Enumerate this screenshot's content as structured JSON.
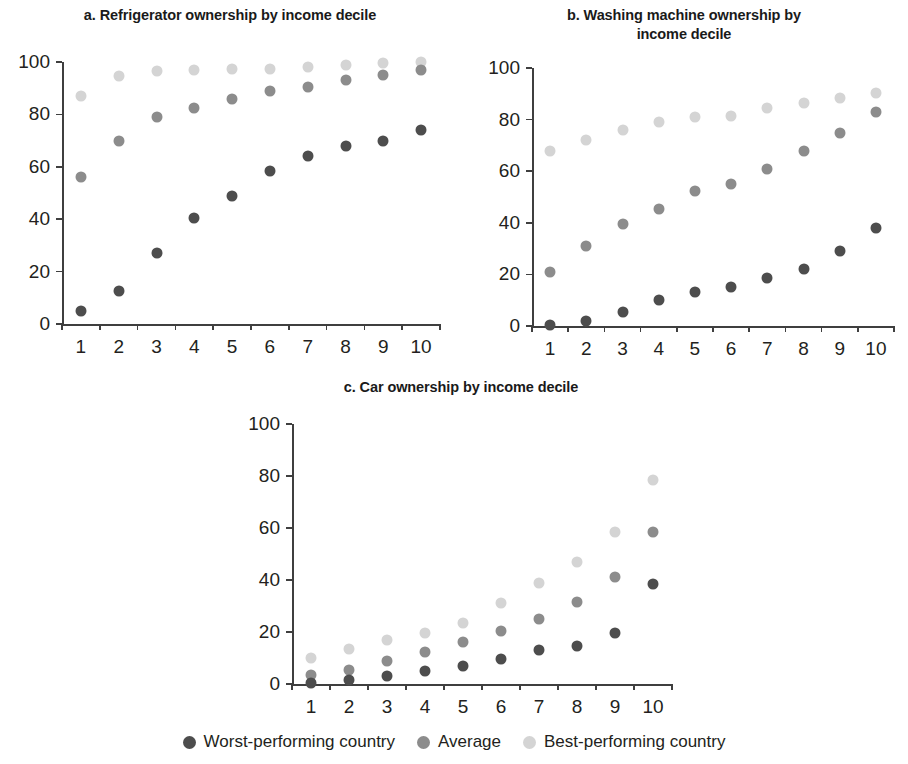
{
  "legend": {
    "items": [
      {
        "label": "Worst-performing country",
        "key": "worst",
        "color": "#4d4d4d"
      },
      {
        "label": "Average",
        "key": "avg",
        "color": "#8c8c8c"
      },
      {
        "label": "Best-performing country",
        "key": "best",
        "color": "#d4d4d4"
      }
    ]
  },
  "chart_data": [
    {
      "type": "scatter",
      "panel": "a",
      "title": "a. Refrigerator ownership by income decile",
      "xlabel": "",
      "ylabel": "",
      "categories": [
        "1",
        "2",
        "3",
        "4",
        "5",
        "6",
        "7",
        "8",
        "9",
        "10"
      ],
      "x": [
        1,
        2,
        3,
        4,
        5,
        6,
        7,
        8,
        9,
        10
      ],
      "xlim": [
        0.5,
        10.5
      ],
      "ylim": [
        0,
        100
      ],
      "yticks": [
        0,
        20,
        40,
        60,
        80,
        100
      ],
      "grid": false,
      "legend_position": "bottom",
      "series": [
        {
          "name": "Worst-performing country",
          "color": "#4d4d4d",
          "values": [
            5,
            12.5,
            27,
            40.5,
            49,
            58.5,
            64,
            68,
            70,
            74
          ]
        },
        {
          "name": "Average",
          "color": "#8c8c8c",
          "values": [
            56,
            70,
            79,
            82.5,
            86,
            89,
            90.5,
            93,
            95,
            97
          ]
        },
        {
          "name": "Best-performing country",
          "color": "#d4d4d4",
          "values": [
            87,
            94.5,
            96.5,
            97,
            97.5,
            97.5,
            98,
            99,
            99.5,
            100
          ]
        }
      ]
    },
    {
      "type": "scatter",
      "panel": "b",
      "title": "b. Washing machine ownership by income decile",
      "xlabel": "",
      "ylabel": "",
      "categories": [
        "1",
        "2",
        "3",
        "4",
        "5",
        "6",
        "7",
        "8",
        "9",
        "10"
      ],
      "x": [
        1,
        2,
        3,
        4,
        5,
        6,
        7,
        8,
        9,
        10
      ],
      "xlim": [
        0.5,
        10.5
      ],
      "ylim": [
        0,
        100
      ],
      "yticks": [
        0,
        20,
        40,
        60,
        80,
        100
      ],
      "grid": false,
      "legend_position": "bottom",
      "series": [
        {
          "name": "Worst-performing country",
          "color": "#4d4d4d",
          "values": [
            0.5,
            2,
            5.5,
            10,
            13,
            15,
            18.5,
            22,
            29,
            38
          ]
        },
        {
          "name": "Average",
          "color": "#8c8c8c",
          "values": [
            21,
            31,
            39.5,
            45.5,
            52.5,
            55,
            61,
            68,
            75,
            83
          ]
        },
        {
          "name": "Best-performing country",
          "color": "#d4d4d4",
          "values": [
            68,
            72,
            76,
            79,
            81,
            81.5,
            84.5,
            86.5,
            88.5,
            90.5
          ]
        }
      ]
    },
    {
      "type": "scatter",
      "panel": "c",
      "title": "c. Car ownership by income decile",
      "xlabel": "",
      "ylabel": "",
      "categories": [
        "1",
        "2",
        "3",
        "4",
        "5",
        "6",
        "7",
        "8",
        "9",
        "10"
      ],
      "x": [
        1,
        2,
        3,
        4,
        5,
        6,
        7,
        8,
        9,
        10
      ],
      "xlim": [
        0.5,
        10.5
      ],
      "ylim": [
        0,
        100
      ],
      "yticks": [
        0,
        20,
        40,
        60,
        80,
        100
      ],
      "grid": false,
      "legend_position": "bottom",
      "series": [
        {
          "name": "Worst-performing country",
          "color": "#4d4d4d",
          "values": [
            0.5,
            1.5,
            3,
            5,
            7,
            9.5,
            13,
            14.5,
            19.5,
            38.5
          ]
        },
        {
          "name": "Average",
          "color": "#8c8c8c",
          "values": [
            3.5,
            5.5,
            9,
            12.5,
            16,
            20.5,
            25,
            31.5,
            41,
            58.5
          ]
        },
        {
          "name": "Best-performing country",
          "color": "#d4d4d4",
          "values": [
            10,
            13.5,
            17,
            19.5,
            23.5,
            31,
            39,
            47,
            58.5,
            78.5
          ]
        }
      ]
    }
  ],
  "panels": {
    "a": {
      "title_lines": [
        "a. Refrigerator ownership by income decile"
      ],
      "box": {
        "left": 0,
        "top": 4,
        "width": 460,
        "height": 366
      },
      "plot": {
        "left": 62,
        "top": 62,
        "width": 378,
        "height": 262
      },
      "title_top": 6
    },
    "b": {
      "title_lines": [
        "b. Washing machine ownership by",
        "income decile"
      ],
      "box": {
        "left": 460,
        "top": 4,
        "width": 448,
        "height": 366
      },
      "plot": {
        "left": 532,
        "top": 68,
        "width": 362,
        "height": 258
      },
      "title_top": 6
    },
    "c": {
      "title_lines": [
        "c. Car ownership by income decile"
      ],
      "box": {
        "left": 226,
        "top": 376,
        "width": 470,
        "height": 340
      },
      "plot": {
        "left": 292,
        "top": 424,
        "width": 380,
        "height": 260
      },
      "title_top": 378
    }
  }
}
